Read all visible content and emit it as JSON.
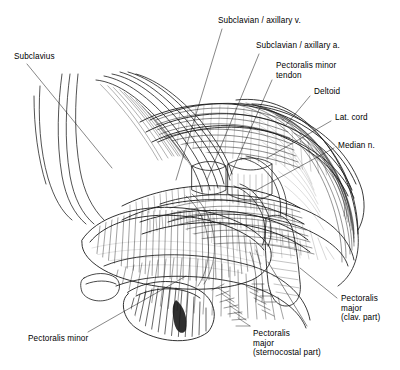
{
  "figure": {
    "kind": "anatomical-illustration",
    "technique": "pen-and-ink line drawing with cross-hatching",
    "region": "Right pectoral and axillary region, anterior view, pectoralis major reflected",
    "background_color": "#ffffff",
    "ink_color": "#1a1a1a",
    "width": 400,
    "height": 370
  },
  "labels": [
    {
      "id": "subclavius",
      "text": "Subclavius",
      "x": 14,
      "y": 52,
      "align": "left",
      "leader": [
        [
          27,
          64
        ],
        [
          112,
          168
        ]
      ]
    },
    {
      "id": "subclavian-axillary-vein",
      "text": "Subclavian / axillary v.",
      "x": 218,
      "y": 16,
      "align": "left",
      "leader": [
        [
          222,
          29
        ],
        [
          176,
          180
        ]
      ]
    },
    {
      "id": "subclavian-axillary-artery",
      "text": "Subclavian / axillary a.",
      "x": 256,
      "y": 41,
      "align": "left",
      "leader": [
        [
          259,
          54
        ],
        [
          207,
          180
        ]
      ]
    },
    {
      "id": "pectoralis-minor-tendon",
      "text": "Pectoralis minor\ntendon",
      "x": 276,
      "y": 61,
      "align": "left",
      "leader": [
        [
          272,
          80
        ],
        [
          230,
          176
        ]
      ]
    },
    {
      "id": "deltoid",
      "text": "Deltoid",
      "x": 314,
      "y": 87,
      "align": "left",
      "leader": [
        [
          310,
          96
        ],
        [
          286,
          125
        ]
      ]
    },
    {
      "id": "lateral-cord",
      "text": "Lat. cord",
      "x": 335,
      "y": 113,
      "align": "left",
      "leader": [
        [
          331,
          121
        ],
        [
          267,
          158
        ]
      ]
    },
    {
      "id": "median-nerve",
      "text": "Median n.",
      "x": 338,
      "y": 141,
      "align": "left",
      "leader": [
        [
          334,
          148
        ],
        [
          253,
          192
        ]
      ]
    },
    {
      "id": "pectoralis-major-clav",
      "text": "Pectoralis\nmajor\n(clav. part)",
      "x": 341,
      "y": 294,
      "align": "left",
      "leader": [
        [
          337,
          298
        ],
        [
          300,
          268
        ]
      ]
    },
    {
      "id": "pectoralis-major-sternocostal",
      "text": "Pectoralis\nmajor\n(sternocostal part)",
      "x": 253,
      "y": 329,
      "align": "left",
      "leader": [
        [
          307,
          326
        ],
        [
          268,
          262
        ]
      ]
    },
    {
      "id": "pectoralis-minor",
      "text": "Pectoralis minor",
      "x": 28,
      "y": 334,
      "align": "left",
      "leader": [
        [
          88,
          332
        ],
        [
          186,
          276
        ]
      ]
    }
  ],
  "structures": [
    {
      "id": "clavicle-pectoral-band",
      "name": "Pectoralis major, clavicular part"
    },
    {
      "id": "pectoralis-major-sternocostal-body",
      "name": "Pectoralis major, sternocostal part (reflected)"
    },
    {
      "id": "pectoralis-minor-belly",
      "name": "Pectoralis minor muscle belly"
    },
    {
      "id": "pectoralis-minor-tendon-strip",
      "name": "Pectoralis minor tendon to coracoid process"
    },
    {
      "id": "axillary-vein",
      "name": "Axillary / subclavian vein"
    },
    {
      "id": "axillary-artery",
      "name": "Axillary / subclavian artery"
    },
    {
      "id": "lateral-cord-branch",
      "name": "Lateral cord of brachial plexus"
    },
    {
      "id": "median-nerve-branch",
      "name": "Median nerve"
    },
    {
      "id": "deltoid-muscle",
      "name": "Deltoid muscle"
    },
    {
      "id": "subclavius-muscle",
      "name": "Subclavius muscle"
    },
    {
      "id": "ribs",
      "name": "Ribs and intercostal musculature"
    }
  ]
}
